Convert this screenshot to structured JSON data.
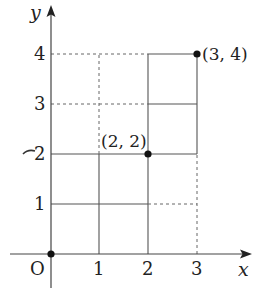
{
  "diagram": {
    "type": "coordinate-grid",
    "axes": {
      "x_label": "x",
      "y_label": "y",
      "origin_label": "O",
      "x_ticks": [
        "1",
        "2",
        "3"
      ],
      "y_ticks": [
        "1",
        "2",
        "3",
        "4"
      ]
    },
    "points": [
      {
        "label": "(0, 0)",
        "x": 0,
        "y": 0,
        "show_label": false
      },
      {
        "label": "(2, 2)",
        "x": 2,
        "y": 2,
        "show_label": true
      },
      {
        "label": "(3, 4)",
        "x": 3,
        "y": 4,
        "show_label": true
      }
    ],
    "point_labels": {
      "p22": "(2, 2)",
      "p34": "(3, 4)"
    },
    "colors": {
      "axis": "#444444",
      "grid_solid": "#555555",
      "grid_dashed": "#666666",
      "point": "#111111",
      "text": "#222222"
    }
  }
}
